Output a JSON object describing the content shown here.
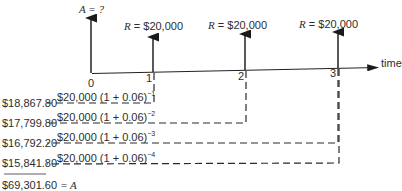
{
  "diagram": {
    "top_labels": {
      "present_value": "A = ?",
      "payments": [
        "R = $20,000",
        "R = $20,000",
        "R = $20,000",
        "R = $20,000"
      ]
    },
    "axis": {
      "label": "time",
      "ticks": [
        "0",
        "1",
        "2",
        "3",
        "4"
      ]
    },
    "discount_terms": [
      {
        "expr": "$20,000 (1 + 0.06)",
        "exponent": "−1",
        "value": "$18,867.80"
      },
      {
        "expr": "$20,000 (1 + 0.06)",
        "exponent": "−2",
        "value": "$17,799.80"
      },
      {
        "expr": "$20,000 (1 + 0.06)",
        "exponent": "−3",
        "value": "$16,792.20"
      },
      {
        "expr": "$20,000 (1 + 0.06)",
        "exponent": "−4",
        "value": "$15,841.80"
      }
    ],
    "total": {
      "value": "$69,301.60",
      "equals": "= A"
    }
  }
}
